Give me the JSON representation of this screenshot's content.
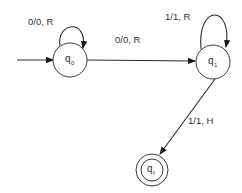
{
  "diagram": {
    "type": "turing-machine-state-diagram",
    "colors": {
      "stroke": "#2a2a2a",
      "text": "#333333",
      "background": "#ffffff"
    },
    "states": [
      {
        "id": "q0",
        "label": "q",
        "subscript": "0",
        "initial": true,
        "accepting": false
      },
      {
        "id": "q1",
        "label": "q",
        "subscript": "1",
        "initial": false,
        "accepting": false
      },
      {
        "id": "qf",
        "label": "q",
        "subscript": "f",
        "initial": false,
        "accepting": true
      }
    ],
    "transitions": [
      {
        "from": "q0",
        "to": "q0",
        "label": "0/0, R"
      },
      {
        "from": "q0",
        "to": "q1",
        "label": "0/0, R"
      },
      {
        "from": "q1",
        "to": "q1",
        "label": "1/1, R"
      },
      {
        "from": "q1",
        "to": "qf",
        "label": "1/1, H"
      }
    ]
  }
}
